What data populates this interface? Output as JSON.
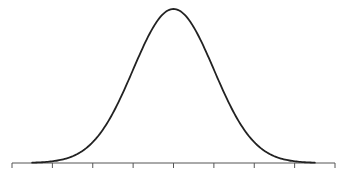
{
  "chart_data": {
    "type": "line",
    "title": "",
    "subtitle": "",
    "xlabel": "",
    "ylabel": "",
    "distribution": "normal",
    "mean": 0,
    "std": 1,
    "x_ticks": [
      -4,
      -3,
      -2,
      -1,
      0,
      1,
      2,
      3,
      4
    ],
    "x_tick_labels": [
      "",
      "",
      "",
      "",
      "",
      "",
      "",
      "",
      ""
    ],
    "xlim": [
      -4,
      4
    ],
    "ylim": [
      0,
      0.4
    ],
    "curve_x_range": [
      -3.5,
      3.5
    ],
    "grid": false,
    "legend": null,
    "line_color": "#222222",
    "axis_color": "#555555",
    "series": [
      {
        "name": "density",
        "x": [
          -3.5,
          -3,
          -2.5,
          -2,
          -1.5,
          -1,
          -0.5,
          0,
          0.5,
          1,
          1.5,
          2,
          2.5,
          3,
          3.5
        ],
        "values": [
          0.0009,
          0.0044,
          0.0175,
          0.054,
          0.1295,
          0.242,
          0.3521,
          0.3989,
          0.3521,
          0.242,
          0.1295,
          0.054,
          0.0175,
          0.0044,
          0.0009
        ]
      }
    ]
  }
}
